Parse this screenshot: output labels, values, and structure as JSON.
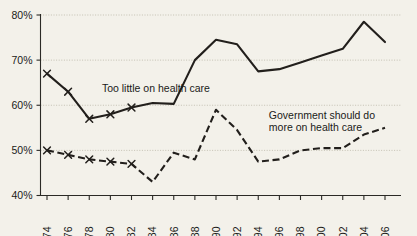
{
  "chart_data": {
    "type": "line",
    "title": "",
    "subtitle": "",
    "xlabel": "",
    "ylabel": "",
    "xlim": [
      1973,
      2007
    ],
    "ylim": [
      40,
      80
    ],
    "ytick_labels": [
      "80%",
      "70%",
      "60%",
      "50%",
      "40%"
    ],
    "ytick_values": [
      80,
      70,
      60,
      50,
      40
    ],
    "grid": true,
    "grid_axis": "y",
    "legend": "inline-annotations",
    "legend_position": "inline",
    "categories": [
      1974,
      1976,
      1978,
      1980,
      1982,
      1984,
      1986,
      1988,
      1990,
      1992,
      1994,
      1996,
      1998,
      2000,
      2002,
      2004,
      2006
    ],
    "xtick_labels": [
      "1974",
      "1976",
      "1978",
      "1980",
      "1982",
      "1984",
      "1986",
      "1988",
      "1990",
      "1992",
      "1994",
      "1996",
      "1998",
      "2000",
      "2002",
      "2004",
      "2006"
    ],
    "series": [
      {
        "name": "Too little on health care",
        "style": "solid",
        "marker": "x",
        "marker_years": [
          1974,
          1976,
          1978,
          1980,
          1982
        ],
        "values": [
          67.0,
          63.0,
          57.0,
          58.0,
          59.5,
          60.5,
          60.3,
          70.0,
          74.5,
          73.5,
          67.5,
          68.0,
          69.5,
          71.0,
          72.5,
          78.5,
          74.0
        ]
      },
      {
        "name": "Government should do more on health care",
        "style": "dashed",
        "marker": "x",
        "marker_years": [
          1974,
          1976,
          1978,
          1980,
          1982
        ],
        "values": [
          50.0,
          49.0,
          48.0,
          47.5,
          47.0,
          43.0,
          49.5,
          48.0,
          59.0,
          54.5,
          47.5,
          48.0,
          50.0,
          50.5,
          50.5,
          53.5,
          55.0
        ]
      }
    ],
    "annotations": [
      {
        "text": "Too little on health care",
        "x": 1979.2,
        "y": 63.0
      },
      {
        "text": "Government should do",
        "x": 1995.0,
        "y": 57.0
      },
      {
        "text": "more on health care",
        "x": 1995.0,
        "y": 54.2
      }
    ],
    "colors": {
      "background": "#f3f1ea",
      "line": "#221f1c",
      "axis": "#2b2a26",
      "grid": "#b9b5a6",
      "text": "#1a1a18"
    }
  }
}
